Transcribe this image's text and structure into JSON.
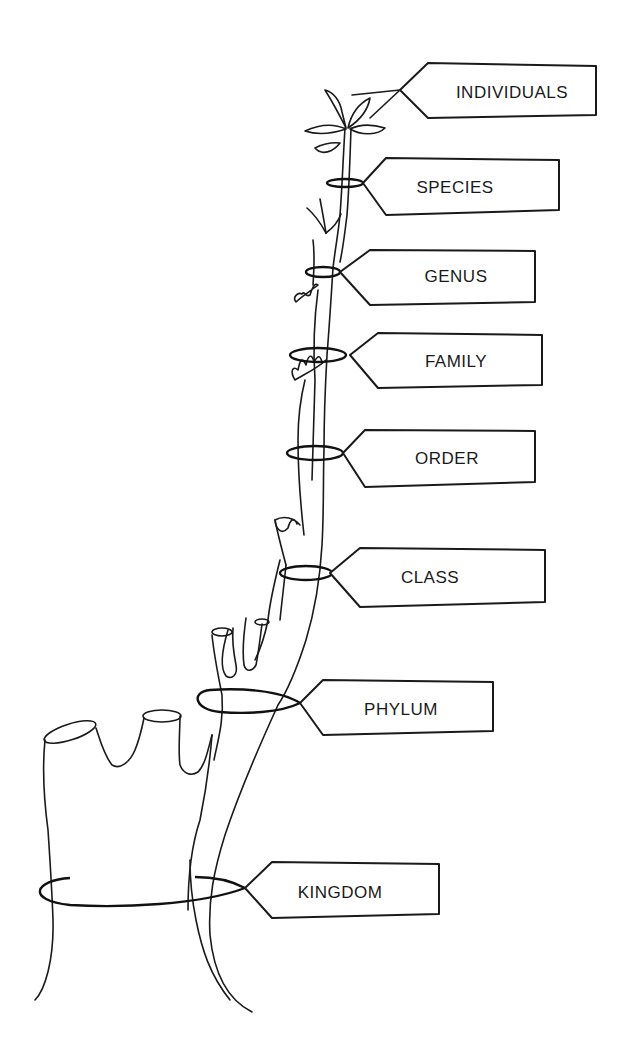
{
  "diagram": {
    "type": "taxonomic-hierarchy-tree",
    "colors": {
      "line": "#1a1a1a",
      "background": "#ffffff"
    },
    "labels": [
      {
        "id": "individuals",
        "text": "INDIVIDUALS"
      },
      {
        "id": "species",
        "text": "SPECIES"
      },
      {
        "id": "genus",
        "text": "GENUS"
      },
      {
        "id": "family",
        "text": "FAMILY"
      },
      {
        "id": "order",
        "text": "ORDER"
      },
      {
        "id": "class",
        "text": "CLASS"
      },
      {
        "id": "phylum",
        "text": "PHYLUM"
      },
      {
        "id": "kingdom",
        "text": "KINGDOM"
      }
    ]
  }
}
